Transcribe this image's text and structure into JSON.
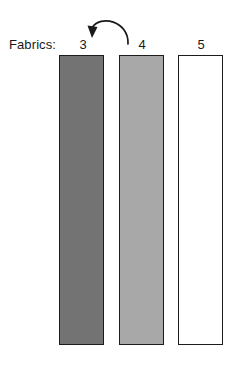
{
  "figure": {
    "background_color": "#ffffff",
    "width": 239,
    "height": 365,
    "axis_label": "Fabrics:"
  },
  "columns": [
    {
      "label": "3",
      "name": "fabric-3",
      "fill_color": "#737373",
      "stroke_color": "#1c1c1c",
      "x": 59,
      "y": 55,
      "width": 45,
      "height": 290,
      "label_x": 71
    },
    {
      "label": "4",
      "name": "fabric-4",
      "fill_color": "#a8a8a8",
      "stroke_color": "#1c1c1c",
      "x": 119,
      "y": 55,
      "width": 45,
      "height": 290,
      "label_x": 130
    },
    {
      "label": "5",
      "name": "fabric-5",
      "fill_color": "#ffffff",
      "stroke_color": "#1c1c1c",
      "x": 178,
      "y": 55,
      "width": 45,
      "height": 290,
      "label_x": 189
    }
  ],
  "annotation": {
    "type": "curved-arrow",
    "name": "transition-arrow",
    "direction": "right-to-left",
    "from_column": "4",
    "to_column": "3",
    "stroke_color": "#1a1a1a",
    "path": "M 128 44 C 129 21 100 14 92 28",
    "head_points": "92,38 87.5,25.5 97.5,27"
  }
}
